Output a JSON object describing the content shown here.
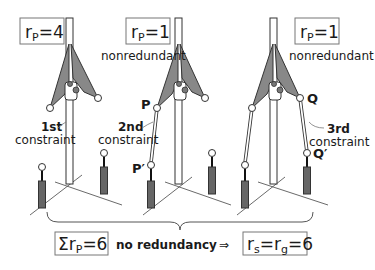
{
  "diagram": {
    "panels": [
      {
        "id": "panel-1",
        "rp_label": "r",
        "rp_sub": "P",
        "rp_value": "=4",
        "constraint_label_1": "1st",
        "constraint_label_2": "constraint"
      },
      {
        "id": "panel-2",
        "rp_label": "r",
        "rp_sub": "P",
        "rp_value": "=1",
        "status": "nonredundant",
        "constraint_label_1": "2nd",
        "constraint_label_2": "constraint",
        "point_top": "P",
        "point_bottom": "P′"
      },
      {
        "id": "panel-3",
        "rp_label": "r",
        "rp_sub": "P",
        "rp_value": "=1",
        "status": "nonredundant",
        "constraint_label_1": "3rd",
        "constraint_label_2": "constraint",
        "point_top": "Q",
        "point_bottom": "Q′"
      }
    ],
    "summary": {
      "sum_symbol": "Σr",
      "sum_sub": "P",
      "sum_value": "=6",
      "middle_text": "no redundancy",
      "implies": "⇒",
      "result_rs": "r",
      "result_rs_sub": "s",
      "result_eq1": "=r",
      "result_rg_sub": "g",
      "result_eq2": "=6"
    },
    "colors": {
      "platform_fill": "#888888",
      "leg_fill": "#666666",
      "line": "#333333",
      "box_border": "#777777"
    }
  }
}
